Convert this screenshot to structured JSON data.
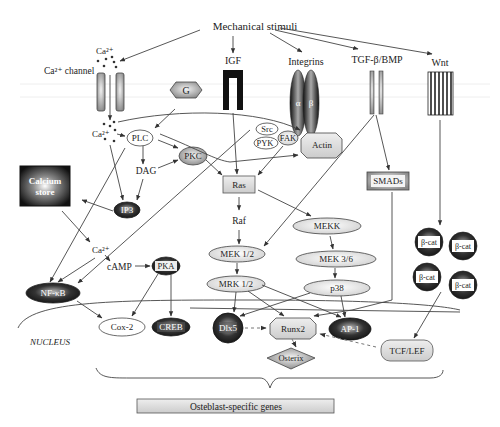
{
  "title": "Mechanical stimuli",
  "receptors": {
    "ca_label": "Ca²⁺",
    "ca_channel": "Ca²⁺ channel",
    "igf": "IGF",
    "integrins": "Integrins",
    "alpha": "α",
    "beta": "β",
    "tgf": "TGF-β/BMP",
    "wnt": "Wnt"
  },
  "nodes": {
    "g": "G",
    "ca_in": "Ca²⁺",
    "plc": "PLC",
    "dag": "DAG",
    "pkc": "PKC",
    "ip3": "IP3",
    "calcium_store_1": "Calcium",
    "calcium_store_2": "store",
    "src": "Src",
    "pyk": "PYK",
    "fak": "FAK",
    "actin": "Actin",
    "ras": "Ras",
    "raf": "Raf",
    "mek12": "MEK 1/2",
    "mrk12": "MRK 1/2",
    "mekk": "MEKK",
    "mek36": "MEK 3/6",
    "p38": "p38",
    "smads": "SMADs",
    "bcat": "β-cat",
    "ca_cyto": "Ca²⁺",
    "camp": "cAMP",
    "pka": "PKA",
    "nfkb": "NF-κB",
    "cox2": "Cox-2",
    "creb": "CREB",
    "dlx5": "Dlx5",
    "runx2": "Runx2",
    "ap1": "AP-1",
    "osterix": "Osterix",
    "tcflef": "TCF/LEF"
  },
  "nucleus_label": "NUCLEUS",
  "genes_box": "Osteblast-specific genes"
}
